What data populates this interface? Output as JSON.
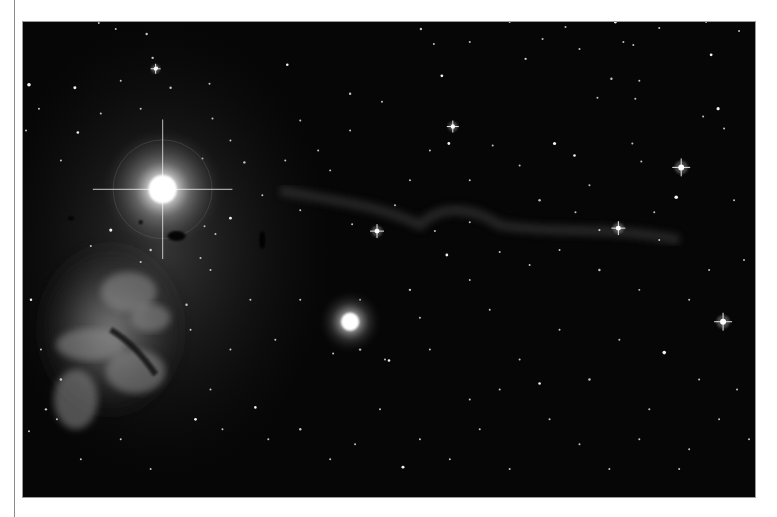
{
  "page": {
    "background": "#ffffff",
    "rule_color": "#8a8a8a"
  },
  "photo": {
    "subject": "astronomical photograph of a star field with a bright star, an emission nebula, a reflection nebula and a faint dark nebula ridge",
    "frame": {
      "x": 22,
      "y": 21,
      "width": 734,
      "height": 477,
      "border": "#9a9a9a",
      "sky": "#050505"
    },
    "bright_star": {
      "cx": 162,
      "cy": 189,
      "core_r": 14,
      "halo_r": 62,
      "spike_len": 70
    },
    "emission_nebula": {
      "cx": 110,
      "cy": 330,
      "rx": 80,
      "ry": 95
    },
    "reflection_nebula": {
      "cx": 350,
      "cy": 322,
      "core_r": 9,
      "halo_r": 32
    },
    "dark_ridge": {
      "path": "M 280 190 C 330 200, 380 205, 420 225 C 440 205, 470 205, 500 225 C 560 235, 610 225, 680 240"
    },
    "dust_blobs": [
      {
        "cx": 176,
        "cy": 236,
        "rx": 9,
        "ry": 5
      },
      {
        "cx": 262,
        "cy": 240,
        "rx": 3,
        "ry": 9
      },
      {
        "cx": 70,
        "cy": 218,
        "rx": 3,
        "ry": 2
      },
      {
        "cx": 140,
        "cy": 222,
        "rx": 2,
        "ry": 2
      }
    ],
    "spiked_stars": [
      {
        "cx": 682,
        "cy": 167,
        "r": 3,
        "spike": 9
      },
      {
        "cx": 724,
        "cy": 322,
        "r": 3,
        "spike": 9
      },
      {
        "cx": 377,
        "cy": 231,
        "r": 2.5,
        "spike": 7
      },
      {
        "cx": 619,
        "cy": 228,
        "r": 2.5,
        "spike": 7
      },
      {
        "cx": 453,
        "cy": 126,
        "r": 2.2,
        "spike": 6
      },
      {
        "cx": 155,
        "cy": 68,
        "r": 2,
        "spike": 5
      }
    ],
    "stars": [
      [
        28,
        84,
        1.8
      ],
      [
        74,
        87,
        1.5
      ],
      [
        98,
        22,
        1
      ],
      [
        115,
        28,
        1
      ],
      [
        146,
        33,
        1.2
      ],
      [
        152,
        57,
        1.2
      ],
      [
        156,
        67,
        1.4
      ],
      [
        170,
        87,
        1.2
      ],
      [
        38,
        108,
        1
      ],
      [
        77,
        132,
        1.3
      ],
      [
        25,
        130,
        1
      ],
      [
        120,
        80,
        1
      ],
      [
        100,
        113,
        1
      ],
      [
        60,
        160,
        1
      ],
      [
        140,
        108,
        1
      ],
      [
        209,
        83,
        1
      ],
      [
        212,
        118,
        1
      ],
      [
        202,
        158,
        1
      ],
      [
        245,
        16,
        1
      ],
      [
        287,
        64,
        1.3
      ],
      [
        320,
        11,
        1
      ],
      [
        350,
        93,
        1.2
      ],
      [
        382,
        101,
        1
      ],
      [
        421,
        28,
        1.2
      ],
      [
        434,
        43,
        1
      ],
      [
        442,
        75,
        1.4
      ],
      [
        470,
        41,
        1
      ],
      [
        510,
        21,
        1
      ],
      [
        526,
        58,
        1.2
      ],
      [
        543,
        38,
        1
      ],
      [
        566,
        26,
        1
      ],
      [
        580,
        48,
        1
      ],
      [
        616,
        21,
        1.5
      ],
      [
        624,
        41,
        1
      ],
      [
        634,
        44,
        1
      ],
      [
        640,
        80,
        1
      ],
      [
        660,
        27,
        1
      ],
      [
        700,
        8,
        1
      ],
      [
        707,
        21,
        1
      ],
      [
        712,
        54,
        1.4
      ],
      [
        719,
        108,
        1.6
      ],
      [
        704,
        116,
        1
      ],
      [
        725,
        128,
        1
      ],
      [
        612,
        78,
        1.2
      ],
      [
        598,
        97,
        1
      ],
      [
        636,
        98,
        1
      ],
      [
        633,
        143,
        1
      ],
      [
        642,
        161,
        1
      ],
      [
        660,
        240,
        1
      ],
      [
        677,
        197,
        1.8
      ],
      [
        555,
        143,
        1.6
      ],
      [
        493,
        145,
        1
      ],
      [
        449,
        143,
        1.4
      ],
      [
        430,
        150,
        1
      ],
      [
        470,
        180,
        1
      ],
      [
        520,
        165,
        1
      ],
      [
        575,
        155,
        1.3
      ],
      [
        590,
        185,
        1
      ],
      [
        540,
        200,
        1.2
      ],
      [
        410,
        180,
        1
      ],
      [
        350,
        130,
        1
      ],
      [
        300,
        120,
        1
      ],
      [
        318,
        150,
        1
      ],
      [
        285,
        160,
        1
      ],
      [
        230,
        140,
        1
      ],
      [
        244,
        162,
        1.2
      ],
      [
        262,
        195,
        1
      ],
      [
        300,
        210,
        1
      ],
      [
        330,
        170,
        1
      ],
      [
        395,
        205,
        1
      ],
      [
        447,
        255,
        1.4
      ],
      [
        470,
        280,
        1
      ],
      [
        500,
        252,
        1
      ],
      [
        530,
        265,
        1
      ],
      [
        560,
        250,
        1
      ],
      [
        600,
        270,
        1.2
      ],
      [
        640,
        290,
        1
      ],
      [
        690,
        300,
        1
      ],
      [
        710,
        270,
        1
      ],
      [
        665,
        353,
        1.8
      ],
      [
        700,
        380,
        1
      ],
      [
        720,
        420,
        1
      ],
      [
        690,
        450,
        1
      ],
      [
        650,
        410,
        1
      ],
      [
        620,
        340,
        1
      ],
      [
        590,
        380,
        1.2
      ],
      [
        560,
        330,
        1
      ],
      [
        520,
        360,
        1
      ],
      [
        490,
        310,
        1
      ],
      [
        470,
        400,
        1
      ],
      [
        430,
        350,
        1
      ],
      [
        410,
        290,
        1.2
      ],
      [
        385,
        360,
        1
      ],
      [
        360,
        300,
        1
      ],
      [
        300,
        300,
        1
      ],
      [
        275,
        340,
        1
      ],
      [
        250,
        300,
        1
      ],
      [
        230,
        350,
        1
      ],
      [
        210,
        390,
        1
      ],
      [
        195,
        420,
        1.4
      ],
      [
        222,
        430,
        1
      ],
      [
        255,
        408,
        1.3
      ],
      [
        268,
        440,
        1
      ],
      [
        300,
        430,
        1.2
      ],
      [
        330,
        460,
        1
      ],
      [
        355,
        445,
        1
      ],
      [
        380,
        410,
        1
      ],
      [
        403,
        468,
        1.5
      ],
      [
        420,
        440,
        1
      ],
      [
        450,
        460,
        1
      ],
      [
        480,
        430,
        1
      ],
      [
        510,
        470,
        1
      ],
      [
        550,
        420,
        1
      ],
      [
        580,
        445,
        1
      ],
      [
        610,
        470,
        1
      ],
      [
        640,
        440,
        1
      ],
      [
        680,
        470,
        1
      ],
      [
        45,
        410,
        1.2
      ],
      [
        56,
        420,
        1
      ],
      [
        28,
        432,
        1
      ],
      [
        80,
        460,
        1
      ],
      [
        120,
        440,
        1
      ],
      [
        150,
        470,
        1
      ],
      [
        30,
        300,
        1.3
      ],
      [
        40,
        350,
        1
      ],
      [
        60,
        380,
        1.2
      ],
      [
        186,
        305,
        1.2
      ],
      [
        210,
        270,
        1
      ],
      [
        190,
        330,
        1
      ],
      [
        360,
        350,
        1.2
      ],
      [
        333,
        354,
        1
      ],
      [
        389,
        361,
        1.3
      ],
      [
        420,
        318,
        1
      ],
      [
        500,
        390,
        1
      ],
      [
        540,
        384,
        1.3
      ],
      [
        735,
        200,
        1
      ],
      [
        745,
        260,
        1
      ],
      [
        738,
        390,
        1
      ],
      [
        750,
        440,
        1
      ],
      [
        740,
        30,
        1
      ],
      [
        600,
        230,
        1.1
      ],
      [
        655,
        212,
        1
      ],
      [
        576,
        212,
        1
      ],
      [
        470,
        222,
        1
      ],
      [
        435,
        231,
        1
      ],
      [
        352,
        224,
        1
      ],
      [
        230,
        218,
        1.4
      ],
      [
        204,
        226,
        1
      ],
      [
        215,
        234,
        1
      ],
      [
        110,
        230,
        1.6
      ],
      [
        90,
        246,
        1
      ],
      [
        150,
        250,
        1.2
      ],
      [
        200,
        258,
        1
      ],
      [
        140,
        262,
        1
      ]
    ]
  }
}
